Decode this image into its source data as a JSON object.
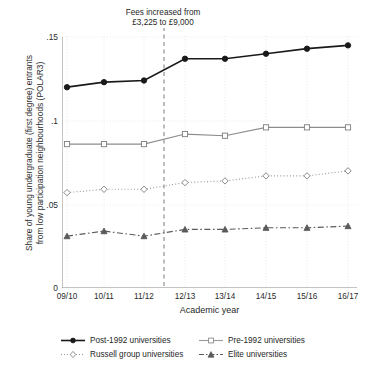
{
  "chart_data": {
    "type": "line",
    "title": "",
    "subtitle": "",
    "xlabel": "Academic year",
    "ylabel": "Share of young undergraduate (first degree) entrants\nfrom low participation neighbourhoods (POLAR3)",
    "categories": [
      "09/10",
      "10/11",
      "11/12",
      "12/13",
      "13/14",
      "14/15",
      "15/16",
      "16/17"
    ],
    "ylim": [
      0,
      0.155
    ],
    "yticks": [
      0,
      0.05,
      0.1,
      0.15
    ],
    "ytick_labels": [
      "0",
      ".05",
      ".1",
      ".15"
    ],
    "grid": true,
    "legend_position": "below",
    "annotations": [
      {
        "text": "Fees increased from\n£3,225 to £9,000",
        "x_between": [
          "11/12",
          "12/13"
        ],
        "line_style": "dashed"
      }
    ],
    "series": [
      {
        "name": "Post-1992 universities",
        "values": [
          0.12,
          0.123,
          0.124,
          0.137,
          0.137,
          0.14,
          0.143,
          0.145
        ],
        "color": "#1a1a1a",
        "marker": "filled-circle",
        "line_style": "solid"
      },
      {
        "name": "Pre-1992 universities",
        "values": [
          0.086,
          0.086,
          0.086,
          0.092,
          0.091,
          0.096,
          0.096,
          0.096
        ],
        "color": "#8c8c8c",
        "marker": "open-square",
        "line_style": "solid"
      },
      {
        "name": "Russell group universities",
        "values": [
          0.057,
          0.059,
          0.059,
          0.063,
          0.064,
          0.067,
          0.067,
          0.07
        ],
        "color": "#9a9a9a",
        "marker": "open-diamond",
        "line_style": "dotted"
      },
      {
        "name": "Elite universities",
        "values": [
          0.031,
          0.034,
          0.031,
          0.035,
          0.035,
          0.036,
          0.036,
          0.037
        ],
        "color": "#5a5a5a",
        "marker": "filled-triangle",
        "line_style": "dash-dot"
      }
    ]
  },
  "legend": {
    "items": [
      {
        "label": "Post-1992 universities"
      },
      {
        "label": "Pre-1992 universities"
      },
      {
        "label": "Russell group universities"
      },
      {
        "label": "Elite universities"
      }
    ]
  }
}
